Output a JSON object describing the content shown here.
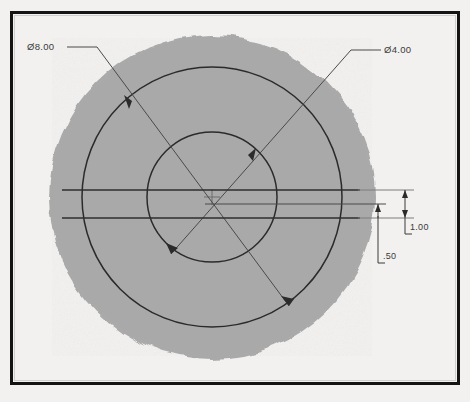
{
  "drawing": {
    "title": "Engineering drawing of circular part with concentric circles",
    "paper_color": "#f2f1ef",
    "border_color": "#1a1a1a",
    "fill_color": "#a8a8a8",
    "line_color": "#2b2b2b",
    "thin_line_color": "#555555",
    "text_color": "#3a3a3a",
    "border": {
      "x": 10,
      "y": 11,
      "width": 450,
      "height": 374,
      "stroke_width": 3
    },
    "blob": {
      "cx": 212,
      "cy": 197,
      "rx": 163,
      "ry": 162
    },
    "circles": [
      {
        "name": "outer-circle",
        "cx": 212,
        "cy": 197,
        "r": 130,
        "dimension": "8.00"
      },
      {
        "name": "inner-circle",
        "cx": 212,
        "cy": 197,
        "r": 65,
        "dimension": "4.00"
      }
    ],
    "center_mark": {
      "cx": 212,
      "cy": 197,
      "size": 9
    },
    "leaders": [
      {
        "name": "diameter-8-leader",
        "label": "Ø8.00",
        "shelf": {
          "x1": 68,
          "y1": 47,
          "x2": 96,
          "y2": 47
        },
        "line": {
          "x1": 96,
          "y1": 47,
          "x2": 288,
          "y2": 305
        },
        "arrows": [
          {
            "x": 132,
            "y": 101
          },
          {
            "x": 288,
            "y": 305
          }
        ]
      },
      {
        "name": "diameter-4-leader",
        "label": "Ø4.00",
        "shelf": {
          "x1": 352,
          "y1": 50,
          "x2": 380,
          "y2": 50
        },
        "line": {
          "x1": 352,
          "y1": 50,
          "x2": 172,
          "y2": 253
        },
        "arrows": [
          {
            "x": 248,
            "y": 155
          },
          {
            "x": 172,
            "y": 253
          }
        ]
      }
    ],
    "horizontal_lines": [
      {
        "name": "upper-slot-line",
        "x1": 62,
        "y1": 190,
        "x2": 400,
        "y2": 190
      },
      {
        "name": "center-axis-line",
        "x1": 205,
        "y1": 204,
        "x2": 378,
        "y2": 204
      },
      {
        "name": "lower-slot-line",
        "x1": 62,
        "y1": 218,
        "x2": 400,
        "y2": 218
      }
    ],
    "dimensions": [
      {
        "name": "overall-height-dimension",
        "value": "1.00",
        "axis_x": 405,
        "y_top": 190,
        "y_bottom": 218,
        "leader": {
          "x1": 405,
          "y1": 218,
          "x2": 405,
          "y2": 234,
          "x3": 410,
          "y3": 234
        }
      },
      {
        "name": "offset-dimension",
        "value": ".50",
        "axis_x": 378,
        "y_top": 204,
        "y_bottom": 218,
        "leader": {
          "x1": 378,
          "y1": 218,
          "x2": 378,
          "y2": 263,
          "x3": 383,
          "y3": 263
        }
      }
    ]
  }
}
